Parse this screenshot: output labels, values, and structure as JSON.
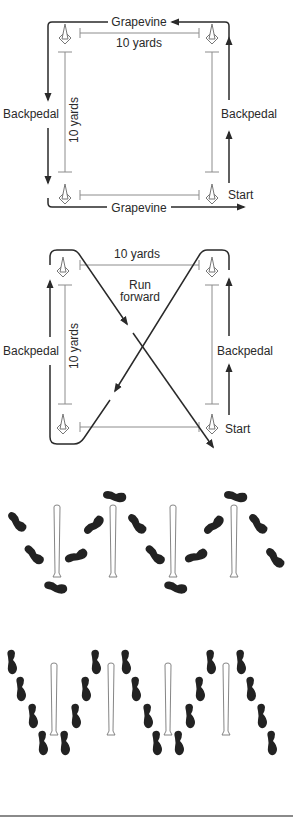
{
  "figures": [
    {
      "id": "drill-box",
      "labels": {
        "top_path": "Grapevine",
        "bottom_path": "Grapevine",
        "top_distance": "10 yards",
        "side_distance": "10 yards",
        "left_path": "Backpedal",
        "right_path": "Backpedal",
        "start": "Start"
      }
    },
    {
      "id": "drill-x",
      "labels": {
        "top_distance": "10 yards",
        "side_distance": "10 yards",
        "center_line1": "Run",
        "center_line2": "forward",
        "left_path": "Backpedal",
        "right_path": "Backpedal",
        "start": "Start"
      }
    },
    {
      "id": "footwork-pattern-1",
      "bat_count": 4,
      "footprint_style": "side-step"
    },
    {
      "id": "footwork-pattern-2",
      "bat_count": 4,
      "footprint_style": "crossover"
    }
  ],
  "colors": {
    "line": "#2a2a2a",
    "thin_line": "#8c8c8c",
    "footprint": "#222222",
    "rule": "#8a8a8a"
  }
}
